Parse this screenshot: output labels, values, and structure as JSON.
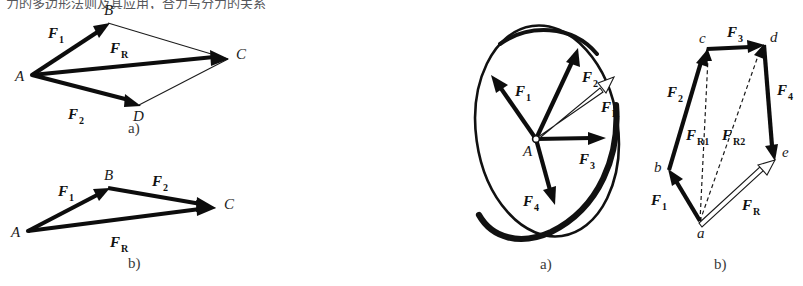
{
  "sheet": {
    "width": 803,
    "height": 286,
    "background": "#ffffff",
    "ink": "#0d0d0d",
    "clipped_top_text": "力的多边形法则及其应用，合力与分力的关系"
  },
  "panels": [
    {
      "id": "panel-a-parallelogram",
      "caption": "a)",
      "caption_x": 128,
      "caption_y": 133,
      "description": "Parallelogram law of force composition",
      "points": [
        {
          "name": "A",
          "label": "A",
          "x": 32,
          "y": 75,
          "label_x": 15,
          "label_y": 81
        },
        {
          "name": "B",
          "label": "B",
          "x": 108,
          "y": 23,
          "label_x": 104,
          "label_y": 15
        },
        {
          "name": "C",
          "label": "C",
          "x": 228,
          "y": 59,
          "label_x": 236,
          "label_y": 59
        },
        {
          "name": "D",
          "label": "D",
          "x": 139,
          "y": 105,
          "label_x": 133,
          "label_y": 121
        }
      ],
      "vectors": [
        {
          "name": "F1",
          "base": "F",
          "sub": "1",
          "style": "thick",
          "from": "A",
          "to": "B",
          "label_x": 48,
          "label_y": 38
        },
        {
          "name": "F2",
          "base": "F",
          "sub": "2",
          "style": "thick",
          "from": "A",
          "to": "D",
          "label_x": 68,
          "label_y": 119
        },
        {
          "name": "FR",
          "base": "F",
          "sub": "R",
          "style": "thick",
          "from": "A",
          "to": "C",
          "label_x": 110,
          "label_y": 53
        }
      ],
      "guides": [
        {
          "from": "B",
          "to": "C"
        },
        {
          "from": "D",
          "to": "C"
        }
      ]
    },
    {
      "id": "panel-b-triangle",
      "caption": "b)",
      "caption_x": 128,
      "caption_y": 268,
      "description": "Triangle rule of force composition",
      "points": [
        {
          "name": "A",
          "label": "A",
          "x": 28,
          "y": 231,
          "label_x": 11,
          "label_y": 237
        },
        {
          "name": "B",
          "label": "B",
          "x": 108,
          "y": 188,
          "label_x": 104,
          "label_y": 180
        },
        {
          "name": "C",
          "label": "C",
          "x": 214,
          "y": 208,
          "label_x": 224,
          "label_y": 209
        }
      ],
      "vectors": [
        {
          "name": "F1",
          "base": "F",
          "sub": "1",
          "style": "thick",
          "from": "A",
          "to": "B",
          "label_x": 58,
          "label_y": 196
        },
        {
          "name": "F2",
          "base": "F",
          "sub": "2",
          "style": "thick",
          "from": "B",
          "to": "C",
          "label_x": 152,
          "label_y": 186
        },
        {
          "name": "FR",
          "base": "F",
          "sub": "R",
          "style": "thick",
          "from": "A",
          "to": "C",
          "label_x": 110,
          "label_y": 247
        }
      ],
      "guides": []
    },
    {
      "id": "panel-c-concurrent",
      "caption": "a)",
      "caption_x": 540,
      "caption_y": 269,
      "description": "Concurrent force system acting on a rigid body",
      "body_shape": {
        "cx": 547,
        "cy": 131,
        "rx": 71,
        "ry": 106,
        "rotation": -8
      },
      "origin": {
        "name": "A",
        "label": "A",
        "x": 536,
        "y": 139,
        "label_x": 523,
        "label_y": 156
      },
      "vectors": [
        {
          "name": "F1",
          "base": "F",
          "sub": "1",
          "style": "thick",
          "to_x": 492,
          "to_y": 77,
          "label_x": 515,
          "label_y": 96
        },
        {
          "name": "F2",
          "base": "F",
          "sub": "2",
          "style": "thick",
          "to_x": 578,
          "to_y": 50,
          "label_x": 582,
          "label_y": 82
        },
        {
          "name": "F3",
          "base": "F",
          "sub": "3",
          "style": "thick",
          "to_x": 605,
          "to_y": 138,
          "label_x": 579,
          "label_y": 164
        },
        {
          "name": "F4",
          "base": "F",
          "sub": "4",
          "style": "thick",
          "to_x": 554,
          "to_y": 204,
          "label_x": 523,
          "label_y": 206
        },
        {
          "name": "FR",
          "base": "F",
          "sub": "R",
          "style": "hollow",
          "to_x": 613,
          "to_y": 78,
          "label_x": 601,
          "label_y": 112
        }
      ]
    },
    {
      "id": "panel-d-force-polygon",
      "caption": "b)",
      "caption_x": 714,
      "caption_y": 269,
      "description": "Force polygon with partial resultants",
      "points": [
        {
          "name": "a",
          "label": "a",
          "x": 700,
          "y": 221,
          "label_x": 697,
          "label_y": 238
        },
        {
          "name": "b",
          "label": "b",
          "x": 669,
          "y": 170,
          "label_x": 654,
          "label_y": 172
        },
        {
          "name": "c",
          "label": "c",
          "x": 707,
          "y": 49,
          "label_x": 699,
          "label_y": 43
        },
        {
          "name": "d",
          "label": "d",
          "x": 764,
          "y": 45,
          "label_x": 770,
          "label_y": 42
        },
        {
          "name": "e",
          "label": "e",
          "x": 774,
          "y": 161,
          "label_x": 782,
          "label_y": 157
        }
      ],
      "vectors": [
        {
          "name": "F1",
          "base": "F",
          "sub": "1",
          "style": "thick",
          "from": "a",
          "to": "b",
          "label_x": 651,
          "label_y": 205
        },
        {
          "name": "F2",
          "base": "F",
          "sub": "2",
          "style": "thick",
          "from": "b",
          "to": "c",
          "label_x": 667,
          "label_y": 97
        },
        {
          "name": "F3",
          "base": "F",
          "sub": "3",
          "style": "thick",
          "from": "c",
          "to": "d",
          "label_x": 727,
          "label_y": 37
        },
        {
          "name": "F4",
          "base": "F",
          "sub": "4",
          "style": "thick",
          "from": "d",
          "to": "e",
          "label_x": 777,
          "label_y": 95
        },
        {
          "name": "FR",
          "base": "F",
          "sub": "R",
          "style": "hollow",
          "from": "a",
          "to": "e",
          "label_x": 742,
          "label_y": 210
        }
      ],
      "partials": [
        {
          "name": "FR1",
          "base": "F",
          "sub": "R1",
          "style": "dashed",
          "from": "a",
          "to": "c",
          "label_x": 704,
          "label_y": 140
        },
        {
          "name": "FR2",
          "base": "F",
          "sub": "R2",
          "style": "dashed",
          "from": "a",
          "to": "d",
          "label_x": 738,
          "label_y": 140
        }
      ]
    }
  ]
}
